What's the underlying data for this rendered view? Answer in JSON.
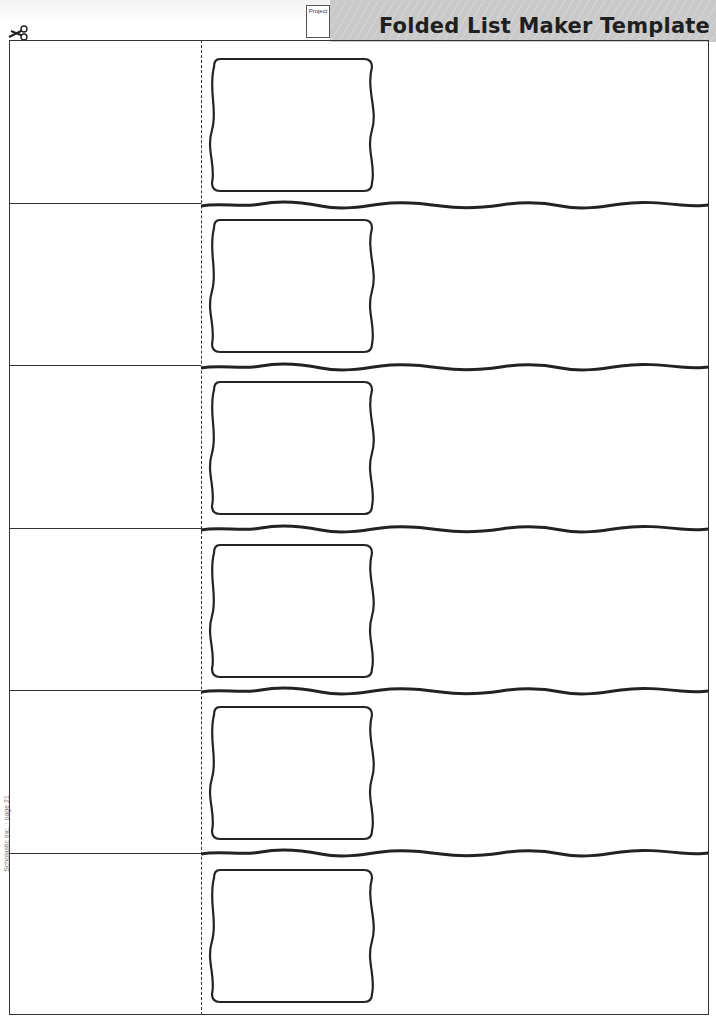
{
  "header": {
    "title": "Folded List Maker Template",
    "project_tag": "Project"
  },
  "icons": {
    "scissors": "scissors-icon"
  },
  "layout": {
    "rows": 6,
    "row_tops": [
      40,
      203,
      365,
      528,
      690,
      853
    ],
    "wave_tops": [
      199,
      361,
      523,
      685,
      847
    ],
    "box_tops": [
      55,
      216,
      378,
      541,
      703,
      866
    ],
    "fold_line_style": "dashed"
  },
  "footer": {
    "side_credit": "Scholastic Inc. · page 21"
  },
  "colors": {
    "ink": "#333333",
    "header_band": "#c9c9c9",
    "title": "#1f1f1f"
  }
}
